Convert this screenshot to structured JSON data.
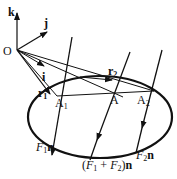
{
  "diagram": {
    "origin_label": "O",
    "axes": {
      "i": "i",
      "j": "j",
      "k": "k"
    },
    "vectors": {
      "r1": "r",
      "r1_sub": "1",
      "r2": "r",
      "r2_sub": "2"
    },
    "points": {
      "A1": "A",
      "A1_sub": "1",
      "A": "A",
      "A2": "A",
      "A2_sub": "2"
    },
    "forces": {
      "F1": {
        "sym": "F",
        "sub": "1",
        "vec": "n"
      },
      "sum": {
        "open": "(",
        "sym1": "F",
        "sub1": "1",
        "plus": " + ",
        "sym2": "F",
        "sub2": "2",
        "close": ")",
        "vec": "n"
      },
      "F2": {
        "sym": "F",
        "sub": "2",
        "vec": "n"
      }
    },
    "colors": {
      "stroke": "#111111",
      "background": "#ffffff"
    }
  }
}
